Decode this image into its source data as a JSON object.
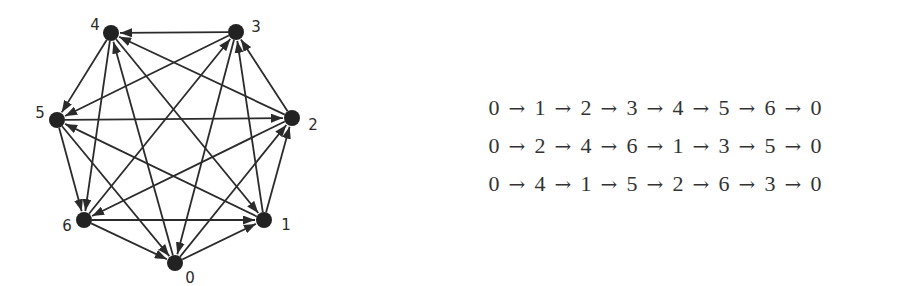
{
  "graph": {
    "title": "",
    "node_color": "#222222",
    "edge_color": "#2b2b2b",
    "nodes": [
      {
        "id": "0",
        "label": "0",
        "x": 175,
        "y": 263,
        "lx": 190,
        "ly": 283
      },
      {
        "id": "1",
        "label": "1",
        "x": 264,
        "y": 220,
        "lx": 286,
        "ly": 230
      },
      {
        "id": "2",
        "label": "2",
        "x": 292,
        "y": 118,
        "lx": 313,
        "ly": 130
      },
      {
        "id": "3",
        "label": "3",
        "x": 236,
        "y": 32,
        "lx": 256,
        "ly": 32
      },
      {
        "id": "4",
        "label": "4",
        "x": 111,
        "y": 33,
        "lx": 95,
        "ly": 30
      },
      {
        "id": "5",
        "label": "5",
        "x": 57,
        "y": 120,
        "lx": 40,
        "ly": 118
      },
      {
        "id": "6",
        "label": "6",
        "x": 84,
        "y": 220,
        "lx": 67,
        "ly": 231
      }
    ],
    "edges": [
      {
        "from": "0",
        "to": "1"
      },
      {
        "from": "1",
        "to": "2"
      },
      {
        "from": "2",
        "to": "3"
      },
      {
        "from": "3",
        "to": "4"
      },
      {
        "from": "4",
        "to": "5"
      },
      {
        "from": "5",
        "to": "6"
      },
      {
        "from": "6",
        "to": "0"
      },
      {
        "from": "0",
        "to": "2"
      },
      {
        "from": "2",
        "to": "4"
      },
      {
        "from": "4",
        "to": "6"
      },
      {
        "from": "6",
        "to": "1"
      },
      {
        "from": "1",
        "to": "3"
      },
      {
        "from": "3",
        "to": "5"
      },
      {
        "from": "5",
        "to": "0"
      },
      {
        "from": "0",
        "to": "4"
      },
      {
        "from": "4",
        "to": "1"
      },
      {
        "from": "1",
        "to": "5"
      },
      {
        "from": "5",
        "to": "2"
      },
      {
        "from": "2",
        "to": "6"
      },
      {
        "from": "6",
        "to": "3"
      },
      {
        "from": "3",
        "to": "0"
      }
    ]
  },
  "tours": {
    "arrow_symbol": "→",
    "rows": [
      {
        "name": "tour-step-1",
        "sequence": [
          "0",
          "1",
          "2",
          "3",
          "4",
          "5",
          "6",
          "0"
        ]
      },
      {
        "name": "tour-step-2",
        "sequence": [
          "0",
          "2",
          "4",
          "6",
          "1",
          "3",
          "5",
          "0"
        ]
      },
      {
        "name": "tour-step-4",
        "sequence": [
          "0",
          "4",
          "1",
          "5",
          "2",
          "6",
          "3",
          "0"
        ]
      }
    ]
  }
}
